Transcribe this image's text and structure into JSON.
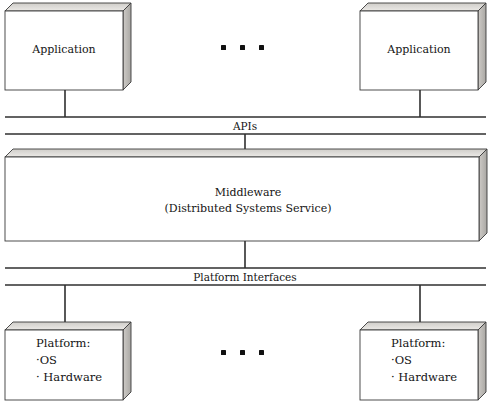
{
  "diagram": {
    "colors": {
      "stroke": "#333333",
      "face": "#ffffff",
      "top_face": "#d6d4d0",
      "side_face": "#bfbdb9",
      "text": "#141414",
      "background": "#ffffff"
    },
    "top_layer": {
      "left_box_label": "Application",
      "right_box_label": "Application",
      "ellipsis": "• • •"
    },
    "api_bar": {
      "label": "APIs"
    },
    "middleware": {
      "line1": "Middleware",
      "line2": "(Distributed Systems Service)"
    },
    "platform_bar": {
      "label": "Platform Interfaces"
    },
    "bottom_layer": {
      "left_box": {
        "title": "Platform:",
        "item1": "·OS",
        "item2": "· Hardware"
      },
      "right_box": {
        "title": "Platform:",
        "item1": "·OS",
        "item2": "· Hardware"
      },
      "ellipsis": "• • •"
    }
  }
}
